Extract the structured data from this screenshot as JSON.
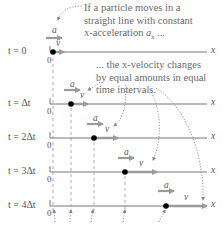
{
  "diagram": {
    "type": "motion-diagram",
    "callouts": {
      "top": [
        "If a particle moves in a",
        "straight line with constant",
        "x-acceleration a_x ..."
      ],
      "middle": [
        "... the x-velocity changes",
        "by equal amounts in equal",
        "time intervals."
      ],
      "bottom_partial": "However, the position changes by different ..."
    },
    "axis_label": "x",
    "origin_label": "0",
    "acceleration_label": "a",
    "velocity_label": "v",
    "frames": [
      {
        "time_label": "t = 0",
        "y": 52,
        "dot_x": 53,
        "v_len": 8
      },
      {
        "time_label": "t = Δt",
        "y": 104,
        "dot_x": 71,
        "v_len": 16
      },
      {
        "time_label": "t = 2Δt",
        "y": 138,
        "dot_x": 94,
        "v_len": 24
      },
      {
        "time_label": "t = 3Δt",
        "y": 172,
        "dot_x": 125,
        "v_len": 32
      },
      {
        "time_label": "t = 4Δt",
        "y": 206,
        "dot_x": 166,
        "v_len": 40
      }
    ],
    "colors": {
      "axis": "#777777",
      "vector": "#9a9a9a",
      "dot": "#000000",
      "text": "#6a6a6a"
    }
  }
}
